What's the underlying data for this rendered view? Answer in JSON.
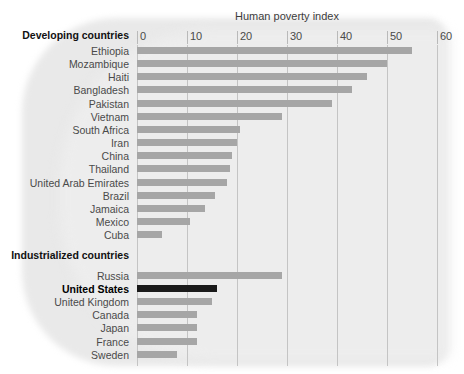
{
  "chart_data": {
    "type": "bar",
    "orientation": "horizontal",
    "title": "Human poverty index",
    "xlabel": "",
    "ylabel": "",
    "xlim": [
      0,
      60
    ],
    "xticks": [
      0,
      10,
      20,
      30,
      40,
      50,
      60
    ],
    "grid": true,
    "legend": null,
    "colors": {
      "bar": "#a6a6a6",
      "highlight_bar": "#1a1a1a",
      "plot_background": "#e9e9e9",
      "gridline": "#c4c4c4",
      "text": "#4a4a4a",
      "group_text": "#111111"
    },
    "groups": [
      {
        "label": "Developing countries",
        "rows": [
          {
            "label": "Ethiopia",
            "value": 55.0,
            "highlight": false
          },
          {
            "label": "Mozambique",
            "value": 50.0,
            "highlight": false
          },
          {
            "label": "Haiti",
            "value": 46.0,
            "highlight": false
          },
          {
            "label": "Bangladesh",
            "value": 43.0,
            "highlight": false
          },
          {
            "label": "Pakistan",
            "value": 39.0,
            "highlight": false
          },
          {
            "label": "Vietnam",
            "value": 29.0,
            "highlight": false
          },
          {
            "label": "South Africa",
            "value": 20.5,
            "highlight": false
          },
          {
            "label": "Iran",
            "value": 20.0,
            "highlight": false
          },
          {
            "label": "China",
            "value": 19.0,
            "highlight": false
          },
          {
            "label": "Thailand",
            "value": 18.5,
            "highlight": false
          },
          {
            "label": "United Arab Emirates",
            "value": 18.0,
            "highlight": false
          },
          {
            "label": "Brazil",
            "value": 15.5,
            "highlight": false
          },
          {
            "label": "Jamaica",
            "value": 13.5,
            "highlight": false
          },
          {
            "label": "Mexico",
            "value": 10.5,
            "highlight": false
          },
          {
            "label": "Cuba",
            "value": 5.0,
            "highlight": false
          }
        ]
      },
      {
        "label": "Industrialized countries",
        "rows": [
          {
            "label": "Russia",
            "value": 29.0,
            "highlight": false
          },
          {
            "label": "United States",
            "value": 16.0,
            "highlight": true
          },
          {
            "label": "United Kingdom",
            "value": 15.0,
            "highlight": false
          },
          {
            "label": "Canada",
            "value": 12.0,
            "highlight": false
          },
          {
            "label": "Japan",
            "value": 12.0,
            "highlight": false
          },
          {
            "label": "France",
            "value": 12.0,
            "highlight": false
          },
          {
            "label": "Sweden",
            "value": 8.0,
            "highlight": false
          }
        ]
      }
    ]
  }
}
